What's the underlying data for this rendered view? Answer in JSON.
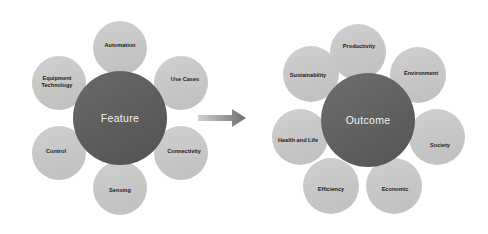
{
  "diagram": {
    "type": "relationship-diagram",
    "transition_icon": "right-arrow-icon",
    "colors": {
      "petal": "#c7c7c7",
      "hub": "#5c5c5c",
      "hub_text": "#f2f2f2",
      "petal_text": "#1c1c1c",
      "arrow": "#8c8c8c",
      "background": "#ffffff"
    },
    "clusters": [
      {
        "id": "feature-cluster",
        "hub_label": "Feature",
        "hub": {
          "cx": 120,
          "cy": 118,
          "r": 47
        },
        "petals": [
          {
            "name": "automation",
            "label": "Automation",
            "cx": 120,
            "cy": 48,
            "r": 27,
            "lx": 120,
            "ly": 46
          },
          {
            "name": "use-cases",
            "label": "Use Cases",
            "cx": 181,
            "cy": 83,
            "r": 27,
            "lx": 185,
            "ly": 80
          },
          {
            "name": "connectivity",
            "label": "Connectivity",
            "cx": 181,
            "cy": 153,
            "r": 27,
            "lx": 184,
            "ly": 152
          },
          {
            "name": "sensing",
            "label": "Sensing",
            "cx": 120,
            "cy": 188,
            "r": 27,
            "lx": 120,
            "ly": 191
          },
          {
            "name": "control",
            "label": "Control",
            "cx": 59,
            "cy": 153,
            "r": 27,
            "lx": 56,
            "ly": 152
          },
          {
            "name": "equipment-technology",
            "label": "Equipment\nTechnology",
            "cx": 59,
            "cy": 83,
            "r": 27,
            "lx": 57,
            "ly": 82
          }
        ]
      },
      {
        "id": "outcome-cluster",
        "hub_label": "Outcome",
        "hub": {
          "cx": 368,
          "cy": 120,
          "r": 47
        },
        "petals": [
          {
            "name": "productivity",
            "label": "Productivity",
            "cx": 358,
            "cy": 52,
            "r": 28,
            "lx": 359,
            "ly": 47
          },
          {
            "name": "environment",
            "label": "Environment",
            "cx": 418,
            "cy": 75,
            "r": 28,
            "lx": 421,
            "ly": 74
          },
          {
            "name": "society",
            "label": "Society",
            "cx": 437,
            "cy": 137,
            "r": 28,
            "lx": 440,
            "ly": 146
          },
          {
            "name": "economic",
            "label": "Economic",
            "cx": 394,
            "cy": 186,
            "r": 28,
            "lx": 395,
            "ly": 190
          },
          {
            "name": "efficiency",
            "label": "Efficiency",
            "cx": 331,
            "cy": 186,
            "r": 28,
            "lx": 331,
            "ly": 190
          },
          {
            "name": "health-and-life",
            "label": "Health and Life",
            "cx": 300,
            "cy": 137,
            "r": 28,
            "lx": 298,
            "ly": 141
          },
          {
            "name": "sustainability",
            "label": "Sustainability",
            "cx": 311,
            "cy": 74,
            "r": 28,
            "lx": 308,
            "ly": 76
          }
        ]
      }
    ]
  }
}
